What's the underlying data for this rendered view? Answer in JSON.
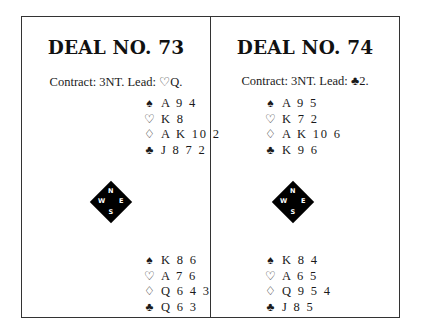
{
  "deals": [
    {
      "title": "DEAL NO. 73",
      "contract": "Contract: 3NT. Lead: ♡Q.",
      "north": {
        "spades": "A 9 4",
        "hearts": "K 8",
        "diamonds": "A K 10 2",
        "clubs": "J 8 7 2"
      },
      "compass": {
        "n": "N",
        "e": "E",
        "s": "S",
        "w": "W"
      },
      "south": {
        "spades": "K 8 6",
        "hearts": "A 7 6",
        "diamonds": "Q 6 4 3",
        "clubs": "Q 6 3"
      }
    },
    {
      "title": "DEAL NO. 74",
      "contract": "Contract: 3NT. Lead: ♣2.",
      "north": {
        "spades": "A 9 5",
        "hearts": "K 7 2",
        "diamonds": "A K 10 6",
        "clubs": "K 9 6"
      },
      "compass": {
        "n": "N",
        "e": "E",
        "s": "S",
        "w": "W"
      },
      "south": {
        "spades": "K 8 4",
        "hearts": "A 6 5",
        "diamonds": "Q 9 5 4",
        "clubs": "J 8 5"
      }
    }
  ],
  "suit_symbols": {
    "spades": "♠",
    "hearts": "♡",
    "diamonds": "♢",
    "clubs": "♣"
  }
}
